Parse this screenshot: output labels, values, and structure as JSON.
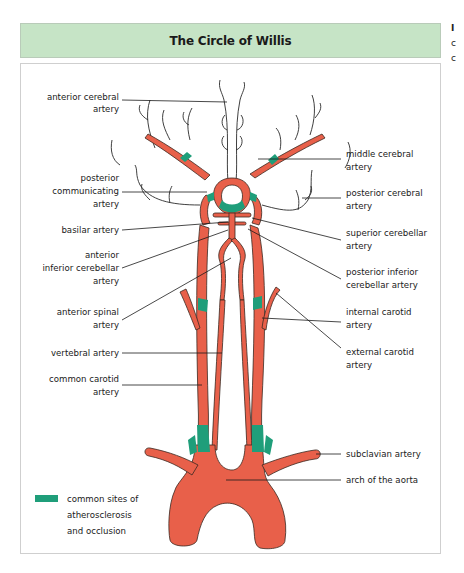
{
  "title": "The Circle of Willis",
  "colors": {
    "title_bg": "#c6e4c6",
    "artery": "#e8604a",
    "occlusion": "#1f9e7a",
    "outline": "#3a2a22"
  },
  "edge_fragments": [
    "I",
    "c",
    "c"
  ],
  "labels_left": [
    {
      "id": "anterior-cerebral",
      "lines": [
        "anterior cerebral",
        "artery"
      ]
    },
    {
      "id": "posterior-communicating",
      "lines": [
        "posterior",
        "communicating",
        "artery"
      ]
    },
    {
      "id": "basilar",
      "lines": [
        "basilar artery"
      ]
    },
    {
      "id": "anterior-inferior-cerebellar",
      "lines": [
        "anterior",
        "inferior cerebellar",
        "artery"
      ]
    },
    {
      "id": "anterior-spinal",
      "lines": [
        "anterior spinal",
        "artery"
      ]
    },
    {
      "id": "vertebral",
      "lines": [
        "vertebral artery"
      ]
    },
    {
      "id": "common-carotid",
      "lines": [
        "common carotid",
        "artery"
      ]
    }
  ],
  "labels_right": [
    {
      "id": "middle-cerebral",
      "lines": [
        "middle cerebral",
        "artery"
      ]
    },
    {
      "id": "posterior-cerebral",
      "lines": [
        "posterior cerebral",
        "artery"
      ]
    },
    {
      "id": "superior-cerebellar",
      "lines": [
        "superior cerebellar",
        "artery"
      ]
    },
    {
      "id": "posterior-inferior-cerebellar",
      "lines": [
        "posterior inferior",
        "cerebellar artery"
      ]
    },
    {
      "id": "internal-carotid",
      "lines": [
        "internal carotid",
        "artery"
      ]
    },
    {
      "id": "external-carotid",
      "lines": [
        "external carotid",
        "artery"
      ]
    },
    {
      "id": "subclavian",
      "lines": [
        "subclavian artery"
      ]
    },
    {
      "id": "arch-aorta",
      "lines": [
        "arch of the aorta"
      ]
    }
  ],
  "legend": {
    "swatch_color": "#1f9e7a",
    "lines": [
      "common sites of",
      "atherosclerosis",
      "and occlusion"
    ]
  }
}
